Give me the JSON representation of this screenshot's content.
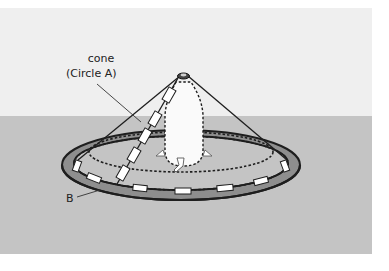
{
  "diagram": {
    "labels": {
      "cone_line1": "cone",
      "cone_line2": "(Circle A)",
      "ring": "B"
    },
    "colors": {
      "sky": "#efefef",
      "ground": "#c4c4c4",
      "ring_fill": "#8e8e8e",
      "outline": "#1e1e1e",
      "marker": "#ffffff",
      "bottle": "#fafafa"
    }
  }
}
